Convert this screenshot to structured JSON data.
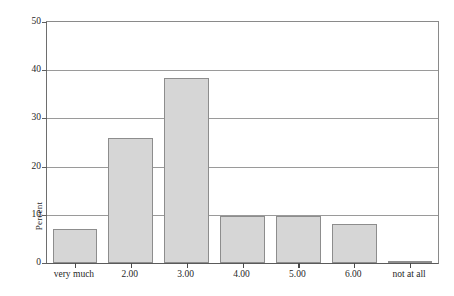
{
  "chart_data": {
    "type": "bar",
    "title": "",
    "subtitle": "",
    "xlabel": "",
    "ylabel": "Percent",
    "categories": [
      "very much",
      "2.00",
      "3.00",
      "4.00",
      "5.00",
      "6.00",
      "not at all"
    ],
    "values": [
      7.0,
      25.9,
      38.3,
      9.8,
      9.8,
      8.0,
      0.3
    ],
    "series": [
      {
        "name": "Percent",
        "values": [
          7.0,
          25.9,
          38.3,
          9.8,
          9.8,
          8.0,
          0.3
        ]
      }
    ],
    "ylim": [
      0,
      50
    ],
    "yticks": [
      0,
      10,
      20,
      30,
      40,
      50
    ],
    "ytick_labels": [
      "0",
      "10",
      "20",
      "30",
      "40",
      "50"
    ],
    "grid": "horizontal",
    "legend": "none",
    "bar_color": "#d6d6d6",
    "bar_border_color": "#8d8d8d",
    "gridline_color": "#9a9a9a",
    "axis_color": "#5f5f5f",
    "background_color": "#ffffff"
  }
}
